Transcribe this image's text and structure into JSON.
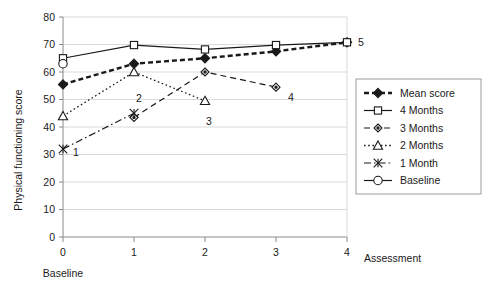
{
  "chart_data": {
    "type": "line",
    "title": "",
    "xlabel": "Assessment",
    "ylabel": "Physical functioning score",
    "x": [
      0,
      1,
      2,
      3,
      4
    ],
    "xticklabels": [
      "0",
      "1",
      "2",
      "3",
      "4"
    ],
    "xlim": [
      0,
      4
    ],
    "ylim": [
      0,
      80
    ],
    "yticks": [
      0,
      10,
      20,
      30,
      40,
      50,
      60,
      70,
      80
    ],
    "yticklabels": [
      "0",
      "10",
      "20",
      "30",
      "40",
      "50",
      "60",
      "70",
      "80"
    ],
    "grid": true,
    "grid_axis": "y",
    "legend_position": "right",
    "baseline_note": "Baseline",
    "series": [
      {
        "name": "Mean score",
        "marker": "filled-diamond",
        "linestyle": "thick-dashed",
        "x": [
          0,
          1,
          2,
          3,
          4
        ],
        "values": [
          55.5,
          63.0,
          65.0,
          67.5,
          70.8
        ]
      },
      {
        "name": "4 Months",
        "marker": "open-square",
        "linestyle": "solid",
        "x": [
          0,
          1,
          2,
          3,
          4
        ],
        "values": [
          65.0,
          69.8,
          68.2,
          69.8,
          70.8
        ]
      },
      {
        "name": "3 Months",
        "marker": "open-diamond",
        "linestyle": "dashed",
        "x": [
          1,
          2,
          3
        ],
        "values": [
          43.5,
          60.0,
          54.5
        ]
      },
      {
        "name": "2 Months",
        "marker": "open-triangle",
        "linestyle": "dotted",
        "x": [
          0,
          1,
          2
        ],
        "values": [
          44.0,
          60.0,
          49.5
        ]
      },
      {
        "name": "1 Month",
        "marker": "star-x",
        "linestyle": "dash-dot",
        "x": [
          0,
          1
        ],
        "values": [
          32.0,
          45.0
        ]
      },
      {
        "name": "Baseline",
        "marker": "open-circle",
        "linestyle": "solid",
        "x": [
          0
        ],
        "values": [
          63.0
        ]
      }
    ],
    "annotations": [
      {
        "text": "1",
        "x": 0,
        "y": 31.0
      },
      {
        "text": "2",
        "x": 1,
        "y": 48.5
      },
      {
        "text": "3",
        "x": 2,
        "y": 45.0
      },
      {
        "text": "4",
        "x": 3,
        "y": 51.0
      },
      {
        "text": "5",
        "x": 4,
        "y": 70.8
      }
    ]
  },
  "legend": {
    "items": [
      {
        "label": "Mean score"
      },
      {
        "label": "4 Months"
      },
      {
        "label": "3 Months"
      },
      {
        "label": "2 Months"
      },
      {
        "label": "1 Month"
      },
      {
        "label": "Baseline"
      }
    ]
  },
  "colors": {
    "ink": "#1a1a1a",
    "grid": "#d9d9d9",
    "axis": "#8a8a8a",
    "background": "#ffffff"
  }
}
